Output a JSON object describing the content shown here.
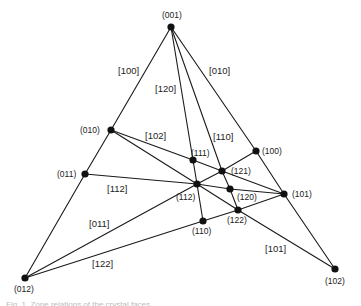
{
  "diagram": {
    "nodes": [
      {
        "id": "001",
        "label": "(001)",
        "x": 171,
        "y": 27,
        "lx": 162,
        "ly": 18
      },
      {
        "id": "010",
        "label": "(010)",
        "x": 111,
        "y": 130,
        "lx": 80,
        "ly": 133
      },
      {
        "id": "011",
        "label": "(011)",
        "x": 85,
        "y": 174,
        "lx": 57,
        "ly": 177
      },
      {
        "id": "012",
        "label": "(012)",
        "x": 25,
        "y": 278,
        "lx": 14,
        "ly": 292
      },
      {
        "id": "100",
        "label": "(100)",
        "x": 256,
        "y": 151,
        "lx": 262,
        "ly": 154
      },
      {
        "id": "101",
        "label": "(101)",
        "x": 284,
        "y": 194,
        "lx": 292,
        "ly": 197
      },
      {
        "id": "102",
        "label": "(102)",
        "x": 335,
        "y": 269,
        "lx": 325,
        "ly": 284
      },
      {
        "id": "111",
        "label": "(111)",
        "x": 193,
        "y": 160,
        "lx": 191,
        "ly": 156
      },
      {
        "id": "121",
        "label": "(121)",
        "x": 222,
        "y": 171,
        "lx": 231,
        "ly": 174
      },
      {
        "id": "112",
        "label": "(112)",
        "x": 197,
        "y": 184,
        "lx": 176,
        "ly": 200
      },
      {
        "id": "120",
        "label": "(120)",
        "x": 230,
        "y": 189,
        "lx": 237,
        "ly": 200
      },
      {
        "id": "122",
        "label": "(122)",
        "x": 238,
        "y": 210,
        "lx": 227,
        "ly": 223
      },
      {
        "id": "110",
        "label": "(110)",
        "x": 203,
        "y": 221,
        "lx": 192,
        "ly": 234
      }
    ],
    "zones": [
      {
        "label": "[100]",
        "path": [
          "001",
          "010",
          "011",
          "012"
        ],
        "lx": 118,
        "ly": 74
      },
      {
        "label": "[010]",
        "path": [
          "001",
          "100",
          "101",
          "102"
        ],
        "lx": 209,
        "ly": 74
      },
      {
        "label": "[120]",
        "path": [
          "001",
          "111",
          "112",
          "110"
        ],
        "lx": 155,
        "ly": 92
      },
      {
        "label": "[110]",
        "path": [
          "001",
          "121",
          "120",
          "122"
        ],
        "lx": 213,
        "ly": 140
      },
      {
        "label": "[102]",
        "path": [
          "010",
          "111",
          "121",
          "101"
        ],
        "lx": 145,
        "ly": 139
      },
      {
        "label": "[101]",
        "path": [
          "010",
          "112",
          "122",
          "102"
        ],
        "lx": 265,
        "ly": 252
      },
      {
        "label": "[112]",
        "path": [
          "011",
          "112",
          "120",
          "101"
        ],
        "lx": 107,
        "ly": 192
      },
      {
        "label": "[011]",
        "path": [
          "012",
          "112",
          "121",
          "100"
        ],
        "lx": 89,
        "ly": 227
      },
      {
        "label": "[122]",
        "path": [
          "012",
          "110",
          "122",
          "101"
        ],
        "lx": 92,
        "ly": 267
      }
    ]
  },
  "caption": "Fig. 1. Zone relations of the crystal faces"
}
